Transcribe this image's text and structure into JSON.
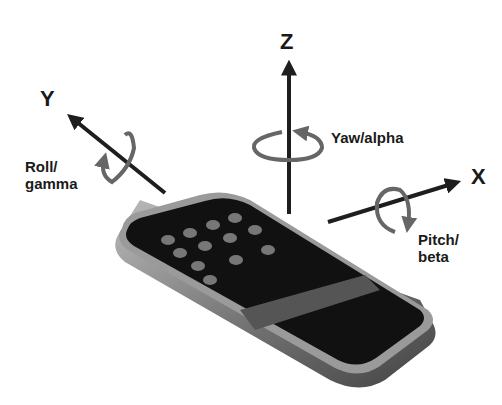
{
  "diagram": {
    "axes": [
      {
        "id": "x",
        "label": "X",
        "rotation_label": "Pitch/\nbeta",
        "rotation_line1": "Pitch/",
        "rotation_line2": "beta"
      },
      {
        "id": "y",
        "label": "Y",
        "rotation_label": "Roll/\ngamma",
        "rotation_line1": "Roll/",
        "rotation_line2": "gamma"
      },
      {
        "id": "z",
        "label": "Z",
        "rotation_label": "Yaw/alpha",
        "rotation_line1": "Yaw/alpha"
      }
    ],
    "colors": {
      "arrow": "#1e1e1e",
      "rotation_arrow": "#666666",
      "phone_body": "#111111",
      "phone_bezel": "#9a9a9a",
      "background": "#ffffff"
    }
  }
}
